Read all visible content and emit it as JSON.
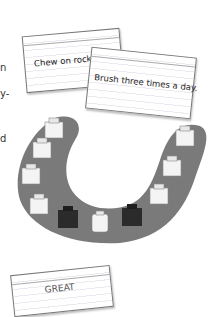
{
  "left_margin_fragments": [
    "n",
    "y-",
    "d"
  ],
  "cards": [
    {
      "text": "Chew on rocks."
    },
    {
      "text": "Brush three times a day."
    },
    {
      "text": "GREAT"
    }
  ],
  "illustration": {
    "subject": "lower-jaw-teeth",
    "teeth_count": 11,
    "dark_teeth_count": 2,
    "colors": {
      "gum": "#7a7a7a",
      "tooth": "#f4f4f4",
      "dark_tooth": "#2b2b2b"
    }
  }
}
